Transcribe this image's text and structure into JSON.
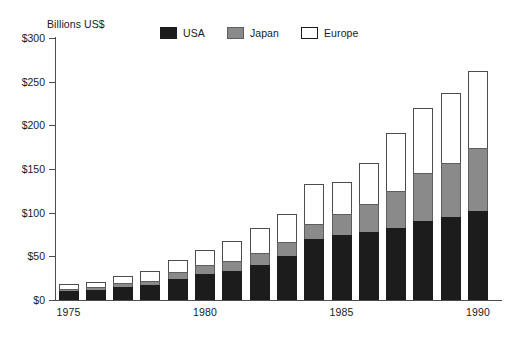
{
  "chart_data": {
    "type": "bar",
    "stacked": true,
    "title": "",
    "subtitle": "",
    "unit_label": "Billions US$",
    "xlabel": "",
    "ylabel": "Billions US$",
    "ylim": [
      0,
      300
    ],
    "y_ticks": [
      0,
      50,
      100,
      150,
      200,
      250,
      300
    ],
    "y_tick_labels": [
      "$0",
      "$50",
      "$100",
      "$150",
      "$200",
      "$250",
      "$300"
    ],
    "grid": false,
    "legend_position": "top-center",
    "categories": [
      "1975",
      "1976",
      "1977",
      "1978",
      "1979",
      "1980",
      "1981",
      "1982",
      "1983",
      "1984",
      "1985",
      "1986",
      "1987",
      "1988",
      "1989",
      "1990"
    ],
    "x_tick_labels": [
      "1975",
      "1980",
      "1985",
      "1990"
    ],
    "x_tick_categories": [
      "1975",
      "1980",
      "1985",
      "1990"
    ],
    "series": [
      {
        "name": "USA",
        "color": "#1c1c1c",
        "values": [
          10,
          11,
          15,
          17,
          24,
          30,
          33,
          40,
          50,
          70,
          75,
          78,
          83,
          90,
          95,
          102
        ]
      },
      {
        "name": "Japan",
        "color": "#8a8a8a",
        "values": [
          3,
          4,
          5,
          5,
          8,
          10,
          12,
          14,
          16,
          17,
          24,
          32,
          42,
          55,
          62,
          72
        ]
      },
      {
        "name": "Europe",
        "color": "#ffffff",
        "values": [
          5,
          6,
          8,
          11,
          14,
          17,
          23,
          28,
          33,
          46,
          36,
          47,
          66,
          75,
          80,
          88
        ]
      }
    ],
    "totals": [
      18,
      21,
      28,
      33,
      46,
      57,
      68,
      82,
      99,
      133,
      135,
      157,
      191,
      220,
      237,
      262
    ]
  },
  "legend": {
    "items": [
      {
        "label": "USA",
        "swatch": "black-swatch"
      },
      {
        "label": "Japan",
        "swatch": "gray-swatch"
      },
      {
        "label": "Europe",
        "swatch": "white-swatch"
      }
    ]
  }
}
